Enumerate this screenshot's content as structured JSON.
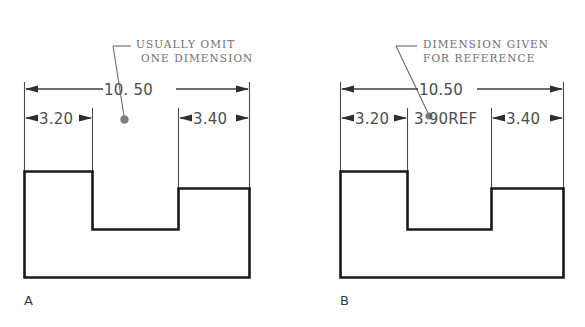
{
  "figure": {
    "type": "engineering-drawing",
    "background_color": "#ffffff",
    "outline_color": "#1a1a1a",
    "dimension_color": "#4d4d4d",
    "note_color": "#6e6e6e"
  },
  "panels": [
    {
      "id": "A",
      "label": "A",
      "note_lines": [
        "USUALLY OMIT",
        "ONE DIMENSION"
      ],
      "dimensions": {
        "overall": "10. 50",
        "left": "3.20",
        "right": "3.40",
        "middle": ""
      },
      "leader_target": "omitted-middle-dimension"
    },
    {
      "id": "B",
      "label": "B",
      "note_lines": [
        "DIMENSION GIVEN",
        "FOR REFERENCE"
      ],
      "dimensions": {
        "overall": "10.50",
        "left": "3.20",
        "right": "3.40",
        "middle": "3.90REF"
      },
      "leader_target": "reference-middle-dimension"
    }
  ]
}
